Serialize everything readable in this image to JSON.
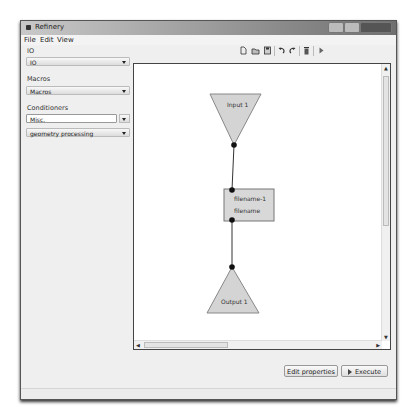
{
  "window": {
    "title": "Refinery",
    "controls": [
      "minimize",
      "maximize",
      "close"
    ]
  },
  "menu": [
    "File",
    "Edit",
    "View"
  ],
  "sidebar": {
    "sections": [
      {
        "label": "IO",
        "combo": "IO"
      },
      {
        "label": "Macros",
        "combo": "Macros"
      },
      {
        "label": "Conditioners",
        "combo": "Misc.",
        "combo2": "geometry processing"
      }
    ]
  },
  "toolbar": {
    "icons": [
      "new-icon",
      "open-icon",
      "save-icon",
      "undo-icon",
      "redo-icon",
      "delete-icon",
      "run-icon"
    ]
  },
  "graph": {
    "nodes": [
      {
        "id": "input",
        "label": "Input 1",
        "shape": "down-triangle"
      },
      {
        "id": "process",
        "label_line1": "filename-1",
        "label_line2": "filename",
        "shape": "rect"
      },
      {
        "id": "output",
        "label": "Output 1",
        "shape": "up-triangle"
      }
    ],
    "colors": {
      "node_fill": "#d4d4d4",
      "node_border": "#888888",
      "port": "#111111",
      "edge": "#333333"
    }
  },
  "buttons": {
    "edit_properties": "Edit properties",
    "execute": "Execute"
  }
}
